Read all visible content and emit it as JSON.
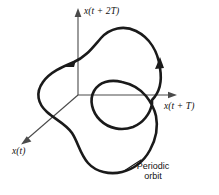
{
  "figure": {
    "kind": "phase-space-diagram",
    "background_color": "#ffffff",
    "ink_color": "#1a1a1a",
    "axis_color": "#4a4a4a",
    "width": 219,
    "height": 195
  },
  "axes": {
    "vertical": {
      "label": "x(t + 2T)",
      "icon": "arrow-up-icon",
      "origin": [
        78,
        95
      ],
      "tip": [
        78,
        11
      ]
    },
    "horizontal": {
      "label": "x(t + T)",
      "icon": "arrow-right-icon",
      "origin": [
        78,
        95
      ],
      "tip": [
        176,
        95
      ]
    },
    "depth": {
      "label": "x(t)",
      "icon": "arrow-down-left-icon",
      "origin": [
        78,
        95
      ],
      "tip": [
        20,
        145
      ]
    }
  },
  "annotations": {
    "periodic_orbit": {
      "line1": "Periodic",
      "line2": "orbit",
      "leader_from": [
        122,
        172
      ],
      "leader_to": [
        140,
        162
      ]
    }
  },
  "curves": {
    "orbit": {
      "name": "periodic-orbit-trajectory",
      "closed": true,
      "self_intersecting": true,
      "stroke_width": 2.6,
      "flow_direction": "counterclockwise"
    },
    "inner_loop": {
      "name": "inner-loop-trajectory",
      "closed": true,
      "stroke_width": 2.2,
      "bounds": [
        92,
        77,
        60,
        51
      ]
    }
  },
  "flow_arrows": [
    {
      "name": "flow-arrow-upper-left",
      "at": [
        68,
        64
      ],
      "direction": "left-down"
    },
    {
      "name": "flow-arrow-right",
      "at": [
        152,
        62
      ],
      "direction": "up"
    }
  ]
}
